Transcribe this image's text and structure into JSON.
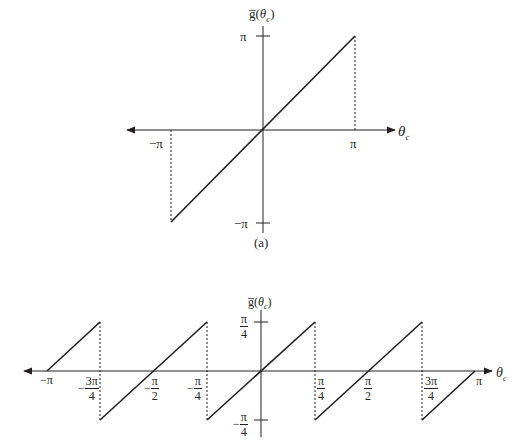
{
  "panel_a": {
    "caption": "(a)",
    "y_axis_label": "g̅(θc)",
    "y_axis_label_parts": {
      "func": "g̅(",
      "var": "θ",
      "sub": "c",
      "close": ")"
    },
    "x_axis_label_parts": {
      "var": "θ",
      "sub": "c"
    },
    "y_ticks": {
      "top": "π",
      "bottom": "−π"
    },
    "x_ticks": {
      "left": "−π",
      "right": "π"
    },
    "description": "Linear function g(θc)=θc on [−π, π] with dashed verticals at ±π"
  },
  "panel_b": {
    "y_axis_label_parts": {
      "func": "g̅(",
      "var": "θ",
      "sub": "c",
      "close": ")"
    },
    "x_axis_label_parts": {
      "var": "θ",
      "sub": "c"
    },
    "y_ticks": {
      "top": {
        "num": "π",
        "den": "4"
      },
      "bottom": {
        "sign": "−",
        "num": "π",
        "den": "4"
      }
    },
    "x_ticks": [
      {
        "id": "neg_pi",
        "text": "−π"
      },
      {
        "id": "neg_3pi_4",
        "sign": "−",
        "num": "3π",
        "den": "4"
      },
      {
        "id": "neg_pi_2",
        "sign": "−",
        "num": "π",
        "den": "2"
      },
      {
        "id": "neg_pi_4",
        "sign": "−",
        "num": "π",
        "den": "4"
      },
      {
        "id": "pi_4",
        "num": "π",
        "den": "4"
      },
      {
        "id": "pi_2",
        "num": "π",
        "den": "2"
      },
      {
        "id": "3pi_4",
        "num": "3π",
        "den": "4"
      },
      {
        "id": "pi",
        "text": "π"
      }
    ],
    "description": "Sawtooth wrapping of θc into [−π/4, π/4] with period π/2"
  }
}
